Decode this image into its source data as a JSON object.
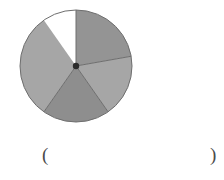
{
  "figure": {
    "caption_open_paren": "(",
    "caption_close_paren": ")",
    "center_dot_color": "#2b2b2b",
    "outline_color": "#6e6e6e",
    "background_color": "#ffffff"
  },
  "chart_data": {
    "type": "pie",
    "title": "",
    "subtitle": "",
    "xlabel": "",
    "ylabel": "",
    "legend": [],
    "legend_position": "none",
    "grid": false,
    "center_x": 76,
    "center_y": 66,
    "radius": 56,
    "start_angle_deg": 90,
    "direction": "clockwise",
    "categories": [
      "sector-1",
      "sector-2",
      "sector-3",
      "sector-4"
    ],
    "values": [
      80,
      65,
      70,
      145
    ],
    "labels": [
      "",
      "",
      "",
      ""
    ],
    "slices": [
      {
        "name": "sector-1",
        "start_angle_deg": 90,
        "end_angle_deg": 10,
        "sweep_deg": 80,
        "color": "#949494"
      },
      {
        "name": "sector-2",
        "start_angle_deg": 10,
        "end_angle_deg": -55,
        "sweep_deg": 65,
        "color": "#a6a6a6"
      },
      {
        "name": "sector-3",
        "start_angle_deg": -55,
        "end_angle_deg": -125,
        "sweep_deg": 70,
        "color": "#8e8e8e"
      },
      {
        "name": "sector-4",
        "start_angle_deg": -125,
        "end_angle_deg": -235,
        "sweep_deg": 110,
        "color": "#a6a6a6"
      }
    ]
  }
}
